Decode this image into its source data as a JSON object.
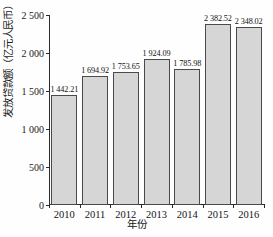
{
  "chart_data": {
    "type": "bar",
    "title": "",
    "subtitle": "",
    "xlabel": "年份",
    "ylabel": "发放贷款额（亿元人民币）",
    "categories": [
      "2010",
      "2011",
      "2012",
      "2013",
      "2014",
      "2015",
      "2016"
    ],
    "values": [
      1442.21,
      1694.92,
      1753.65,
      1924.09,
      1785.98,
      2382.52,
      2348.02
    ],
    "value_labels": [
      "1 442.21",
      "1 694.92",
      "1 753.65",
      "1 924.09",
      "1 785.98",
      "2 382.52",
      "2 348.02"
    ],
    "series": [
      {
        "name": "发放贷款额",
        "values": [
          1442.21,
          1694.92,
          1753.65,
          1924.09,
          1785.98,
          2382.52,
          2348.02
        ]
      }
    ],
    "ylim": [
      0,
      2500
    ],
    "ytick_values": [
      0,
      500,
      1000,
      1500,
      2000,
      2500
    ],
    "ytick_labels": [
      "0",
      "500",
      "1 000",
      "1 500",
      "2 000",
      "2 500"
    ],
    "grid": false,
    "legend": false,
    "legend_position": "none",
    "bar_fill_color": "#d6d6d6",
    "bar_border_color": "#4a4a4a",
    "axis_color": "#2a2a2a",
    "background_color": "#fefefe"
  }
}
